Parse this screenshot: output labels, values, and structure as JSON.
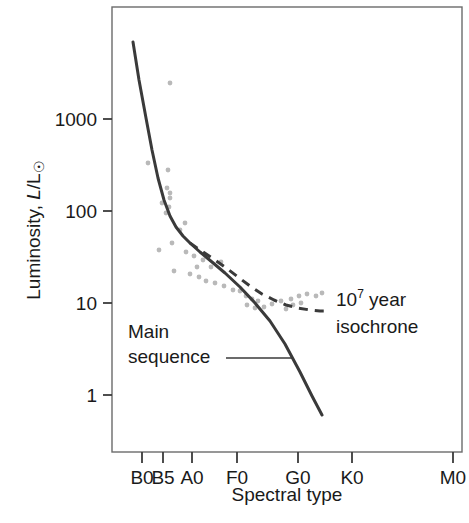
{
  "chart_data": {
    "type": "scatter",
    "title": "",
    "xlabel": "Spectral type",
    "ylabel": "Luminosity, L/L☉",
    "ylabel_parts": {
      "prefix": "Luminosity, ",
      "italic": "L",
      "slash": "/L",
      "sun_symbol": "☉"
    },
    "x_tick_labels": [
      "B0",
      "B5",
      "A0",
      "F0",
      "G0",
      "K0",
      "M0"
    ],
    "x_tick_positions": [
      142,
      163,
      192,
      237,
      298,
      352,
      453
    ],
    "y_tick_labels": [
      "1000",
      "100",
      "10",
      "1"
    ],
    "y_tick_values": [
      1000,
      100,
      10,
      1
    ],
    "y_tick_positions": [
      119,
      211,
      303,
      395
    ],
    "ylim": [
      0.35,
      9000
    ],
    "yscale": "log",
    "grid": false,
    "legend_position": "inline-annotation",
    "scatter_color": "#b9b9b9",
    "curve_color": "#3a3a3a",
    "frame_color": "#6b6b6b",
    "series": [
      {
        "name": "Main sequence",
        "style": "solid",
        "label": "Main sequence",
        "label_lines": [
          "Main",
          "sequence"
        ],
        "points_px": [
          [
            133,
            42
          ],
          [
            139,
            80
          ],
          [
            146,
            118
          ],
          [
            152,
            150
          ],
          [
            158,
            178
          ],
          [
            164,
            200
          ],
          [
            170,
            216
          ],
          [
            176,
            227
          ],
          [
            183,
            236
          ],
          [
            190,
            243
          ],
          [
            200,
            252
          ],
          [
            212,
            262
          ],
          [
            225,
            273
          ],
          [
            240,
            287
          ],
          [
            255,
            303
          ],
          [
            270,
            321
          ],
          [
            285,
            344
          ],
          [
            300,
            372
          ],
          [
            312,
            396
          ],
          [
            322,
            415
          ]
        ]
      },
      {
        "name": "10^7 year isochrone",
        "style": "dashed",
        "label": "10⁷ year isochrone",
        "label_line1_base": "10",
        "label_line1_sup": "7",
        "label_line1_rest": " year",
        "label_line2": "isochrone",
        "points_px": [
          [
            190,
            243
          ],
          [
            200,
            250
          ],
          [
            212,
            258
          ],
          [
            225,
            267
          ],
          [
            238,
            277
          ],
          [
            250,
            286
          ],
          [
            262,
            294
          ],
          [
            274,
            300
          ],
          [
            286,
            305
          ],
          [
            298,
            308
          ],
          [
            310,
            310
          ],
          [
            320,
            311
          ],
          [
            326,
            311
          ]
        ]
      }
    ],
    "data_points_px": [
      [
        170,
        83
      ],
      [
        148,
        163
      ],
      [
        168,
        170
      ],
      [
        167,
        188
      ],
      [
        170,
        193
      ],
      [
        162,
        203
      ],
      [
        170,
        198
      ],
      [
        169,
        207
      ],
      [
        166,
        213
      ],
      [
        185,
        223
      ],
      [
        180,
        230
      ],
      [
        172,
        243
      ],
      [
        159,
        250
      ],
      [
        186,
        252
      ],
      [
        194,
        256
      ],
      [
        203,
        260
      ],
      [
        197,
        267
      ],
      [
        211,
        267
      ],
      [
        221,
        262
      ],
      [
        174,
        271
      ],
      [
        190,
        274
      ],
      [
        199,
        277
      ],
      [
        206,
        281
      ],
      [
        215,
        283
      ],
      [
        224,
        286
      ],
      [
        233,
        290
      ],
      [
        240,
        291
      ],
      [
        246,
        296
      ],
      [
        252,
        299
      ],
      [
        258,
        301
      ],
      [
        247,
        305
      ],
      [
        255,
        308
      ],
      [
        264,
        307
      ],
      [
        272,
        304
      ],
      [
        281,
        301
      ],
      [
        291,
        299
      ],
      [
        299,
        296
      ],
      [
        307,
        294
      ],
      [
        316,
        296
      ],
      [
        322,
        293
      ],
      [
        293,
        305
      ],
      [
        301,
        303
      ],
      [
        286,
        309
      ]
    ],
    "annotations": [
      {
        "name": "main-sequence-label",
        "text_lines": [
          "Main",
          "sequence"
        ],
        "x": 128,
        "y": 338,
        "leader_line": {
          "x1": 226,
          "y1": 358,
          "x2": 292,
          "y2": 358
        }
      },
      {
        "name": "isochrone-label",
        "text_lines": [
          "10⁷ year",
          "isochrone"
        ],
        "x": 336,
        "y": 306
      }
    ]
  },
  "axes": {
    "x_axis_title": "Spectral type",
    "frame": {
      "left": 112,
      "top": 7,
      "right": 462,
      "bottom": 452
    }
  }
}
